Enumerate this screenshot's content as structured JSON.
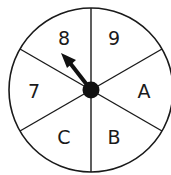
{
  "spinner": {
    "sections": [
      {
        "label": "9",
        "x": 114,
        "y": 45
      },
      {
        "label": "A",
        "x": 144,
        "y": 98
      },
      {
        "label": "B",
        "x": 114,
        "y": 144
      },
      {
        "label": "C",
        "x": 64,
        "y": 144
      },
      {
        "label": "7",
        "x": 34,
        "y": 98
      },
      {
        "label": "8",
        "x": 64,
        "y": 45
      }
    ],
    "pointer_target": "8",
    "colors": {
      "stroke": "#1a1a1a",
      "fill": "#ffffff"
    }
  }
}
